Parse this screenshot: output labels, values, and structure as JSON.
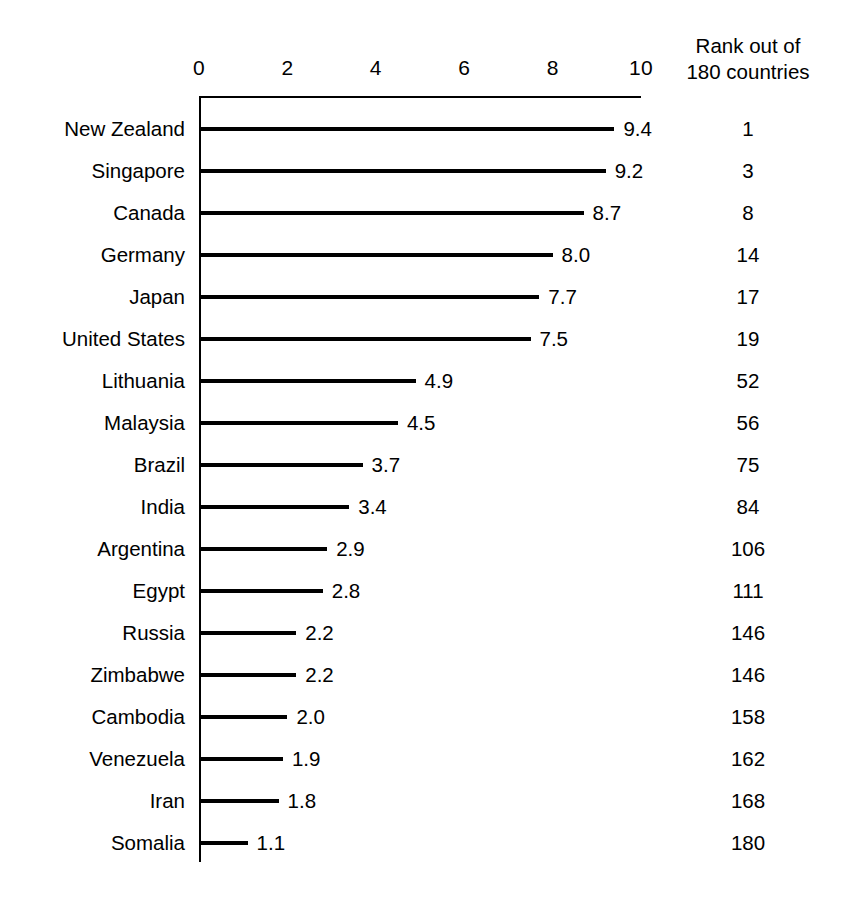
{
  "chart_data": {
    "type": "bar",
    "orientation": "horizontal",
    "title": "",
    "subtitle": "",
    "xlabel": "",
    "ylabel": "",
    "xlim": [
      0,
      10
    ],
    "xticks": [
      "0",
      "2",
      "4",
      "6",
      "8",
      "10"
    ],
    "xtick_values": [
      0,
      2,
      4,
      6,
      8,
      10
    ],
    "grid": false,
    "legend": null,
    "bar_color": "#000000",
    "background_color": "#ffffff",
    "categories": [
      "New Zealand",
      "Singapore",
      "Canada",
      "Germany",
      "Japan",
      "United States",
      "Lithuania",
      "Malaysia",
      "Brazil",
      "India",
      "Argentina",
      "Egypt",
      "Russia",
      "Zimbabwe",
      "Cambodia",
      "Venezuela",
      "Iran",
      "Somalia"
    ],
    "values": [
      9.4,
      9.2,
      8.7,
      8.0,
      7.7,
      7.5,
      4.9,
      4.5,
      3.7,
      3.4,
      2.9,
      2.8,
      2.2,
      2.2,
      2.0,
      1.9,
      1.8,
      1.1
    ],
    "value_labels": [
      "9.4",
      "9.2",
      "8.7",
      "8.0",
      "7.7",
      "7.5",
      "4.9",
      "4.5",
      "3.7",
      "3.4",
      "2.9",
      "2.8",
      "2.2",
      "2.2",
      "2.0",
      "1.9",
      "1.8",
      "1.1"
    ],
    "ranks": [
      1,
      3,
      8,
      14,
      17,
      19,
      52,
      56,
      75,
      84,
      106,
      111,
      146,
      146,
      158,
      162,
      168,
      180
    ],
    "rank_labels": [
      "1",
      "3",
      "8",
      "14",
      "17",
      "19",
      "52",
      "56",
      "75",
      "84",
      "106",
      "111",
      "146",
      "146",
      "158",
      "162",
      "168",
      "180"
    ]
  },
  "rank_column": {
    "header_line1": "Rank out of",
    "header_line2": "180 countries"
  }
}
